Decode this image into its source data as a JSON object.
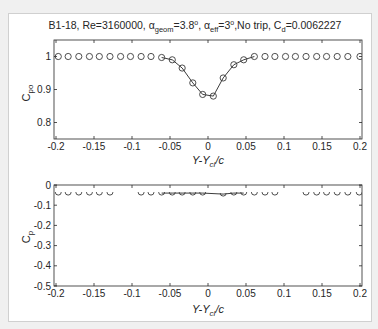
{
  "figure": {
    "title_parts": {
      "prefix": "B1-18, Re=3160000, α",
      "geom_sub": "geom",
      "geom_val": "=3.8",
      "deg1": "o",
      "eff_alpha": ", α",
      "eff_sub": "eff",
      "eff_val": "=3",
      "deg2": "o",
      "trip": ",No trip, C",
      "cd_sub": "d",
      "cd_val": "=0.0062227"
    }
  },
  "chart_data": [
    {
      "type": "line",
      "title": "B1-18, Re=3160000, α_geom=3.8°, α_eff=3°, No trip, C_d=0.0062227",
      "xlabel": "Y-Y_cl/c",
      "ylabel": "C_po",
      "xlim": [
        -0.2,
        0.2
      ],
      "ylim": [
        0.75,
        1.05
      ],
      "xticks": [
        -0.2,
        -0.15,
        -0.1,
        -0.05,
        0,
        0.05,
        0.1,
        0.15,
        0.2
      ],
      "xtick_labels": [
        "-0.2",
        "-0.15",
        "-0.1",
        "-0.05",
        "0",
        "0.05",
        "0.1",
        "0.15",
        "0.2"
      ],
      "yticks": [
        0.8,
        0.9,
        1.0
      ],
      "ytick_labels": [
        "0.8",
        "0.9",
        "1"
      ],
      "grid": false,
      "series": [
        {
          "name": "markers",
          "style": "circle-open",
          "x": [
            -0.197,
            -0.184,
            -0.17,
            -0.156,
            -0.143,
            -0.129,
            -0.115,
            -0.102,
            -0.088,
            -0.075,
            -0.061,
            -0.047,
            -0.034,
            -0.02,
            -0.007,
            0.007,
            0.02,
            0.034,
            0.047,
            0.061,
            0.075,
            0.088,
            0.102,
            0.115,
            0.129,
            0.143,
            0.156,
            0.17,
            0.184,
            0.2
          ],
          "y": [
            1.0,
            1.0,
            1.0,
            1.0,
            1.0,
            1.0,
            1.0,
            1.0,
            1.0,
            1.0,
            0.997,
            0.99,
            0.965,
            0.92,
            0.885,
            0.88,
            0.935,
            0.975,
            0.99,
            1.0,
            1.0,
            1.0,
            1.0,
            1.0,
            1.0,
            1.0,
            1.0,
            1.0,
            1.0,
            1.0
          ]
        },
        {
          "name": "fit-line",
          "style": "solid",
          "x": [
            -0.061,
            -0.047,
            -0.034,
            -0.02,
            -0.007,
            0.007,
            0.02,
            0.034,
            0.047,
            0.061
          ],
          "y": [
            0.997,
            0.99,
            0.965,
            0.92,
            0.885,
            0.88,
            0.935,
            0.975,
            0.99,
            1.0
          ]
        }
      ]
    },
    {
      "type": "line",
      "title": "",
      "xlabel": "Y-Y_cl/c",
      "ylabel": "C_p",
      "xlim": [
        -0.2,
        0.2
      ],
      "ylim": [
        -0.5,
        0
      ],
      "xticks": [
        -0.2,
        -0.15,
        -0.1,
        -0.05,
        0,
        0.05,
        0.1,
        0.15,
        0.2
      ],
      "xtick_labels": [
        "-0.2",
        "-0.15",
        "-0.1",
        "-0.05",
        "0",
        "0.05",
        "0.1",
        "0.15",
        "0.2"
      ],
      "yticks": [
        -0.5,
        -0.4,
        -0.3,
        -0.2,
        -0.1,
        0
      ],
      "ytick_labels": [
        "-0.5",
        "-0.4",
        "-0.3",
        "-0.2",
        "-0.1",
        "0"
      ],
      "grid": false,
      "series": [
        {
          "name": "markers",
          "style": "circle-open-clipped",
          "x": [
            -0.197,
            -0.184,
            -0.17,
            -0.156,
            -0.143,
            -0.129,
            -0.088,
            -0.075,
            -0.061,
            -0.047,
            -0.034,
            -0.02,
            -0.007,
            0.02,
            0.034,
            0.047,
            0.061,
            0.075,
            0.088,
            0.129,
            0.143,
            0.156,
            0.17,
            0.184,
            0.199
          ],
          "y": [
            -0.04,
            -0.04,
            -0.04,
            -0.04,
            -0.04,
            -0.04,
            -0.04,
            -0.04,
            -0.04,
            -0.04,
            -0.04,
            -0.04,
            -0.04,
            -0.045,
            -0.04,
            -0.04,
            -0.04,
            -0.04,
            -0.04,
            -0.04,
            -0.04,
            -0.04,
            -0.04,
            -0.04,
            -0.04
          ]
        },
        {
          "name": "fit-line",
          "style": "solid",
          "x": [
            -0.061,
            -0.047,
            -0.034,
            -0.02,
            -0.007,
            0.02,
            0.034,
            0.047
          ],
          "y": [
            -0.04,
            -0.04,
            -0.04,
            -0.04,
            -0.04,
            -0.045,
            -0.04,
            -0.04
          ]
        }
      ]
    }
  ],
  "axes": {
    "top": {
      "ylabel_main": "C",
      "ylabel_sub": "po",
      "xlabel_main": "Y-Y",
      "xlabel_sub": "cl",
      "xlabel_tail": "/c"
    },
    "bottom": {
      "ylabel_main": "C",
      "ylabel_sub": "p",
      "xlabel_main": "Y-Y",
      "xlabel_sub": "cl",
      "xlabel_tail": "/c"
    }
  },
  "colors": {
    "axis": "#262626",
    "marker": "#3a3a3a",
    "line": "#262626",
    "background": "#ffffff",
    "figure_bg": "#f0f0f0"
  }
}
